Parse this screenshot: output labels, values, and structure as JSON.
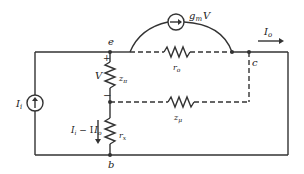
{
  "diagram": {
    "type": "small-signal equivalent circuit",
    "nodes": {
      "e": "e",
      "c": "c",
      "b": "b"
    },
    "labels": {
      "source_current": "I",
      "source_current_sub": "i",
      "output_current": "I",
      "output_current_sub": "o",
      "branch_current_a": "I",
      "branch_current_a_sub": "i",
      "branch_current_minus": " − I",
      "branch_current_b_sub": "o",
      "voltage": "V",
      "plus": "+",
      "minus": "−",
      "dep_source": "g",
      "dep_source_sub": "m",
      "dep_source_var": "V",
      "r_o": "r",
      "r_o_sub": "o",
      "z_pi": "z",
      "z_pi_sub": "π",
      "z_mu": "z",
      "z_mu_sub": "μ",
      "r_x": "r",
      "r_x_sub": "x"
    },
    "colors": {
      "line": "#333333",
      "background": "#ffffff"
    }
  }
}
